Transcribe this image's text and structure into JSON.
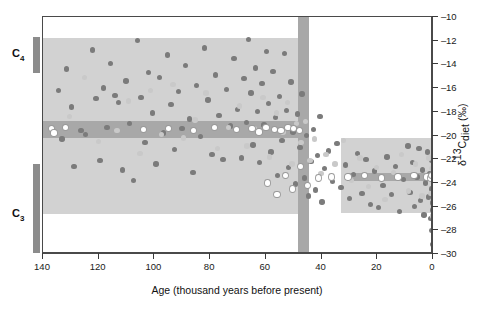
{
  "figure": {
    "xtitle": "Age (thousand years before present)",
    "ytitle_parts": {
      "delta": "δ",
      "sup": "13",
      "c": "C",
      "sub": "diet",
      "unit": " (‰)"
    },
    "ytitle_plain": "δ13Cdiet (‰)"
  },
  "categories": {
    "c4": {
      "label": "C",
      "subscript": "4"
    },
    "c3": {
      "label": "C",
      "subscript": "3"
    }
  },
  "chart_data": {
    "type": "scatter",
    "title": "",
    "xlabel": "Age (thousand years before present)",
    "ylabel": "δ13Cdiet (‰)",
    "xlim": [
      140,
      0
    ],
    "ylim": [
      -30,
      -10
    ],
    "x_reversed": true,
    "xticks": [
      140,
      120,
      100,
      80,
      60,
      40,
      20,
      0
    ],
    "yticks": [
      -10,
      -12,
      -14,
      -16,
      -18,
      -20,
      -22,
      -24,
      -26,
      -28,
      -30
    ],
    "grid": false,
    "legend": null,
    "annotations": [
      {
        "name": "c4-range-bar",
        "label": "C4",
        "y_range": [
          -11.8,
          -14.8
        ]
      },
      {
        "name": "c3-range-bar",
        "label": "C3",
        "y_range": [
          -22.5,
          -30.0
        ]
      },
      {
        "name": "old-sample-envelope",
        "x_range": [
          140,
          47
        ],
        "y_range": [
          -26.6,
          -11.8
        ]
      },
      {
        "name": "transition-band",
        "x_range": [
          48.5,
          44.5
        ],
        "y_range": [
          -30.0,
          -10.0
        ]
      },
      {
        "name": "recent-sample-envelope",
        "x_range": [
          33,
          0
        ],
        "y_range": [
          -26.5,
          -20.2
        ]
      },
      {
        "name": "old-mean-band",
        "x_range": [
          140,
          44.5
        ],
        "y_range": [
          -20.2,
          -18.8
        ],
        "value": -19.5
      },
      {
        "name": "recent-mean-band",
        "x_range": [
          31,
          0
        ],
        "y_range": [
          -23.8,
          -23.2
        ],
        "value": -23.5
      }
    ],
    "series": [
      {
        "name": "dark markers",
        "color": "#7b7b7b",
        "points": [
          [
            134.5,
            -16.2
          ],
          [
            133.2,
            -20.3
          ],
          [
            131.6,
            -14.4
          ],
          [
            129.8,
            -17.6
          ],
          [
            128.9,
            -22.6
          ],
          [
            126.4,
            -19.6
          ],
          [
            124.8,
            -19.9
          ],
          [
            122.3,
            -12.8
          ],
          [
            121.0,
            -16.9
          ],
          [
            119.6,
            -22.1
          ],
          [
            118.2,
            -16.0
          ],
          [
            117.0,
            -19.3
          ],
          [
            115.7,
            -13.9
          ],
          [
            114.2,
            -16.6
          ],
          [
            112.9,
            -17.2
          ],
          [
            111.4,
            -22.9
          ],
          [
            110.2,
            -15.4
          ],
          [
            108.9,
            -19.0
          ],
          [
            107.6,
            -23.8
          ],
          [
            106.1,
            -12.0
          ],
          [
            104.8,
            -16.8
          ],
          [
            103.4,
            -20.6
          ],
          [
            102.1,
            -14.7
          ],
          [
            100.8,
            -18.1
          ],
          [
            99.4,
            -22.4
          ],
          [
            98.1,
            -15.1
          ],
          [
            96.8,
            -19.8
          ],
          [
            95.4,
            -13.2
          ],
          [
            94.1,
            -17.4
          ],
          [
            92.8,
            -21.2
          ],
          [
            91.4,
            -16.3
          ],
          [
            90.1,
            -19.4
          ],
          [
            88.8,
            -14.1
          ],
          [
            87.4,
            -18.6
          ],
          [
            86.1,
            -23.1
          ],
          [
            84.8,
            -15.8
          ],
          [
            83.4,
            -20.1
          ],
          [
            82.1,
            -12.6
          ],
          [
            80.8,
            -17.0
          ],
          [
            79.4,
            -21.6
          ],
          [
            78.1,
            -14.9
          ],
          [
            76.8,
            -18.3
          ],
          [
            75.4,
            -22.0
          ],
          [
            74.1,
            -16.1
          ],
          [
            72.8,
            -19.2
          ],
          [
            71.4,
            -13.5
          ],
          [
            70.1,
            -17.8
          ],
          [
            68.8,
            -21.9
          ],
          [
            67.9,
            -15.2
          ],
          [
            67.0,
            -18.9
          ],
          [
            66.2,
            -11.9
          ],
          [
            65.4,
            -16.4
          ],
          [
            64.6,
            -20.8
          ],
          [
            63.8,
            -14.3
          ],
          [
            63.0,
            -18.0
          ],
          [
            62.2,
            -22.3
          ],
          [
            61.4,
            -15.6
          ],
          [
            60.6,
            -19.1
          ],
          [
            59.8,
            -12.9
          ],
          [
            59.0,
            -17.3
          ],
          [
            58.2,
            -21.4
          ],
          [
            57.4,
            -14.6
          ],
          [
            56.6,
            -18.5
          ],
          [
            55.8,
            -23.4
          ],
          [
            55.0,
            -16.7
          ],
          [
            54.2,
            -20.4
          ],
          [
            53.4,
            -13.1
          ],
          [
            52.6,
            -17.9
          ],
          [
            51.8,
            -22.7
          ],
          [
            51.0,
            -15.5
          ],
          [
            50.2,
            -19.7
          ],
          [
            49.4,
            -24.1
          ],
          [
            48.6,
            -18.2
          ],
          [
            47.8,
            -21.0
          ],
          [
            47.0,
            -16.5
          ],
          [
            46.2,
            -23.6
          ],
          [
            45.4,
            -20.0
          ],
          [
            44.6,
            -25.1
          ],
          [
            43.8,
            -22.2
          ],
          [
            43.0,
            -19.5
          ],
          [
            42.2,
            -24.6
          ],
          [
            41.4,
            -21.7
          ],
          [
            40.6,
            -18.4
          ],
          [
            39.8,
            -25.6
          ],
          [
            39.0,
            -22.8
          ],
          [
            37.5,
            -21.3
          ],
          [
            36.0,
            -23.9
          ],
          [
            34.5,
            -20.7
          ],
          [
            33.0,
            -24.4
          ],
          [
            31.5,
            -22.5
          ],
          [
            30.0,
            -25.3
          ],
          [
            28.5,
            -23.3
          ],
          [
            27.0,
            -21.5
          ],
          [
            25.5,
            -24.9
          ],
          [
            24.0,
            -22.0
          ],
          [
            22.5,
            -25.8
          ],
          [
            21.0,
            -23.0
          ],
          [
            19.5,
            -26.1
          ],
          [
            18.0,
            -24.2
          ],
          [
            16.5,
            -21.8
          ],
          [
            15.0,
            -25.0
          ],
          [
            13.5,
            -22.6
          ],
          [
            12.0,
            -26.4
          ],
          [
            10.5,
            -23.7
          ],
          [
            9.0,
            -20.9
          ],
          [
            8.2,
            -24.8
          ],
          [
            7.4,
            -22.3
          ],
          [
            6.6,
            -26.0
          ],
          [
            5.8,
            -23.5
          ],
          [
            5.0,
            -21.1
          ],
          [
            4.4,
            -25.5
          ],
          [
            3.8,
            -22.9
          ],
          [
            3.2,
            -26.7
          ],
          [
            2.6,
            -24.0
          ],
          [
            2.0,
            -21.4
          ],
          [
            1.6,
            -25.2
          ],
          [
            1.2,
            -23.2
          ],
          [
            0.9,
            -27.0
          ],
          [
            0.6,
            -24.5
          ],
          [
            0.4,
            -22.1
          ],
          [
            0.3,
            -28.0
          ],
          [
            0.2,
            -25.7
          ],
          [
            0.15,
            -23.6
          ],
          [
            0.1,
            -29.2
          ],
          [
            0.05,
            -26.3
          ]
        ]
      },
      {
        "name": "light markers",
        "color": "#c9c9c9",
        "points": [
          [
            130.5,
            -18.4
          ],
          [
            125.2,
            -15.1
          ],
          [
            120.1,
            -20.5
          ],
          [
            113.5,
            -19.6
          ],
          [
            109.4,
            -17.1
          ],
          [
            105.2,
            -21.5
          ],
          [
            101.3,
            -16.2
          ],
          [
            97.5,
            -19.9
          ],
          [
            93.4,
            -15.7
          ],
          [
            89.5,
            -20.2
          ],
          [
            85.4,
            -18.7
          ],
          [
            81.5,
            -16.4
          ],
          [
            77.4,
            -21.1
          ],
          [
            73.5,
            -19.3
          ],
          [
            69.5,
            -17.5
          ],
          [
            66.8,
            -20.9
          ],
          [
            64.2,
            -19.4
          ],
          [
            61.0,
            -16.8
          ],
          [
            58.6,
            -21.8
          ],
          [
            56.2,
            -18.1
          ],
          [
            53.8,
            -19.7
          ],
          [
            52.2,
            -17.2
          ],
          [
            50.6,
            -22.4
          ],
          [
            49.0,
            -19.0
          ],
          [
            47.4,
            -20.6
          ],
          [
            45.8,
            -18.8
          ],
          [
            44.2,
            -22.1
          ],
          [
            42.6,
            -20.3
          ],
          [
            40.2,
            -23.2
          ],
          [
            38.4,
            -21.6
          ],
          [
            35.2,
            -22.4
          ],
          [
            32.2,
            -20.4
          ],
          [
            29.2,
            -23.8
          ],
          [
            26.2,
            -21.9
          ],
          [
            23.2,
            -24.3
          ],
          [
            20.2,
            -22.7
          ],
          [
            17.2,
            -25.4
          ],
          [
            14.2,
            -23.1
          ],
          [
            11.2,
            -21.6
          ],
          [
            8.8,
            -24.7
          ],
          [
            6.2,
            -22.4
          ],
          [
            4.0,
            -25.1
          ],
          [
            2.4,
            -23.4
          ],
          [
            1.4,
            -21.9
          ],
          [
            0.8,
            -24.9
          ],
          [
            0.35,
            -22.8
          ],
          [
            0.25,
            -26.8
          ]
        ]
      },
      {
        "name": "open markers",
        "color": "#ffffff",
        "edge": "#9a9a9a",
        "points": [
          [
            137.0,
            -19.4
          ],
          [
            136.0,
            -19.8
          ],
          [
            132.0,
            -19.3
          ],
          [
            104.0,
            -19.5
          ],
          [
            95.0,
            -19.4
          ],
          [
            86.0,
            -19.6
          ],
          [
            78.5,
            -19.3
          ],
          [
            70.5,
            -19.5
          ],
          [
            65.0,
            -19.4
          ],
          [
            62.5,
            -19.7
          ],
          [
            60.0,
            -19.3
          ],
          [
            57.0,
            -19.5
          ],
          [
            54.5,
            -19.6
          ],
          [
            52.0,
            -19.3
          ],
          [
            50.0,
            -19.4
          ],
          [
            48.0,
            -19.6
          ],
          [
            59.5,
            -24.0
          ],
          [
            56.0,
            -25.0
          ],
          [
            53.0,
            -23.4
          ],
          [
            50.5,
            -24.5
          ],
          [
            47.5,
            -22.6
          ],
          [
            45.0,
            -24.2
          ],
          [
            41.0,
            -23.6
          ],
          [
            36.5,
            -23.5
          ],
          [
            30.5,
            -23.5
          ],
          [
            24.5,
            -23.4
          ],
          [
            18.5,
            -23.6
          ],
          [
            12.5,
            -23.5
          ],
          [
            6.8,
            -23.4
          ],
          [
            2.2,
            -23.5
          ],
          [
            0.7,
            -23.6
          ],
          [
            0.45,
            -23.4
          ]
        ]
      }
    ]
  }
}
